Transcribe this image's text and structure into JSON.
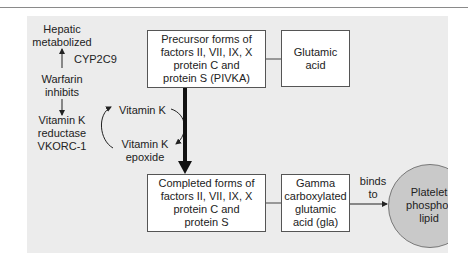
{
  "diagram": {
    "left_column": {
      "hepatic": "Hepatic\nmetabolized",
      "enzyme": "CYP2C9",
      "warfarin": "Warfarin\ninhibits",
      "reductase": "Vitamin K\nreductase\nVKORC-1"
    },
    "cycle": {
      "vitamin_k": "Vitamin K",
      "vitamin_k_epoxide": "Vitamin K\nepoxide"
    },
    "boxes": {
      "precursor": "Precursor forms of\nfactors II, VII, IX, X\nprotein C and\nprotein S (PIVKA)",
      "glutamic_acid": "Glutamic\nacid",
      "completed": "Completed forms of\nfactors II, VII, IX, X\nprotein C and\nprotein S",
      "gla": "Gamma\ncarboxylated\nglutamic\nacid (gla)"
    },
    "binds_label": "binds\nto",
    "platelet": "Platelet\nphospho-\nlipid",
    "colors": {
      "panel": "#ececec",
      "box_border": "#555555",
      "circle_fill": "#c9c9c9",
      "arrow": "#222222"
    }
  }
}
